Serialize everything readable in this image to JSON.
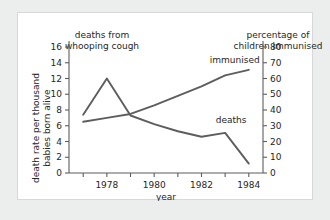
{
  "chart_data": {
    "type": "line",
    "title": "",
    "titles": {
      "left_axis_heading": "deaths from\nwhooping cough",
      "right_axis_heading": "percentage of\nchildren immunised"
    },
    "xlabel": "year",
    "ylabel": "death rate per thousand\nbabies born alive",
    "y2label": "percentage of children immunised",
    "x": [
      1977,
      1978,
      1979,
      1980,
      1981,
      1982,
      1983,
      1984
    ],
    "xlim": [
      1976.4,
      1984.6
    ],
    "xticks": [
      1978,
      1980,
      1982,
      1984
    ],
    "xticklabels": [
      "1978",
      "1980",
      "1982",
      "1984"
    ],
    "xminorticks": [
      1977,
      1979,
      1981,
      1983
    ],
    "ylim": [
      0,
      16
    ],
    "yticks": [
      0,
      2,
      4,
      6,
      8,
      10,
      12,
      14,
      16
    ],
    "yticklabels": [
      "0",
      "2",
      "4",
      "6",
      "8",
      "10",
      "12",
      "14",
      "16"
    ],
    "y2lim": [
      0,
      80
    ],
    "y2ticks": [
      0,
      10,
      20,
      30,
      40,
      50,
      60,
      70,
      80
    ],
    "y2ticklabels": [
      "0",
      "10",
      "20",
      "30",
      "40",
      "50",
      "60",
      "70",
      "80"
    ],
    "grid": false,
    "legend": "inline-annotations",
    "series": [
      {
        "name": "deaths",
        "axis": "left",
        "units": "deaths per thousand babies born alive",
        "color": "#5d5d5d",
        "label_text": "deaths",
        "values": [
          7.4,
          12.0,
          7.3,
          6.2,
          5.3,
          4.6,
          5.1,
          1.2
        ]
      },
      {
        "name": "immunised",
        "axis": "right",
        "units": "percentage of children immunised",
        "color": "#5d5d5d",
        "label_text": "immunised",
        "values": [
          32.5,
          35.0,
          37.5,
          43.0,
          49.0,
          55.0,
          62.0,
          65.5
        ]
      }
    ]
  },
  "annotations": {
    "deaths_label": "deaths",
    "immunised_label": "immunised"
  }
}
